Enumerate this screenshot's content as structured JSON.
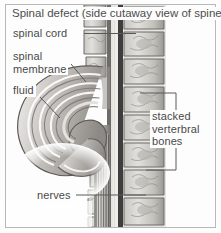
{
  "figure": {
    "title": "Spinal defect (side cutaway view of spine)",
    "style": "grayscale medical line-and-wash illustration",
    "labels": {
      "spinal_cord": "spinal cord",
      "spinal_membrane": "spinal\nmembrane",
      "fluid": "fluid",
      "stacked_vertebral_bones": "stacked\nverterbral\nbones",
      "nerves": "nerves"
    },
    "colors": {
      "frame": "#b9b9b9",
      "background": "#fdfdfd",
      "text": "#4a4a4a",
      "leader_line": "#5a5a5a",
      "bone_light": "#d8d6d2",
      "bone_mid": "#b2b0ab",
      "bone_dark": "#6f6d69",
      "canal_dark": "#3a3a3a",
      "sac_light": "#e9e7e4",
      "sac_mid": "#a8a5a1",
      "sac_dark": "#5e5c58"
    }
  }
}
